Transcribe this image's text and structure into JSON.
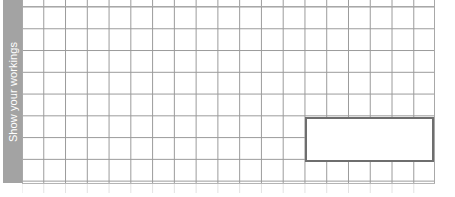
{
  "page": {
    "background_color": "#ffffff"
  },
  "sidebar": {
    "label": "Show your workings",
    "background_color": "#a3a3a3",
    "text_color": "#ffffff",
    "orientation": "vertical-bottom-to-top"
  },
  "grid": {
    "type": "graph-paper",
    "columns": 19,
    "rows": 8,
    "cell_size_px": 22,
    "line_color": "#9a9a9a",
    "background_color": "#ffffff"
  },
  "answer_box": {
    "value": "",
    "placeholder": "",
    "border_color": "#6e6e6e",
    "fill_color": "#ffffff",
    "grid_columns_spanned": 6,
    "grid_rows_spanned": 2
  }
}
